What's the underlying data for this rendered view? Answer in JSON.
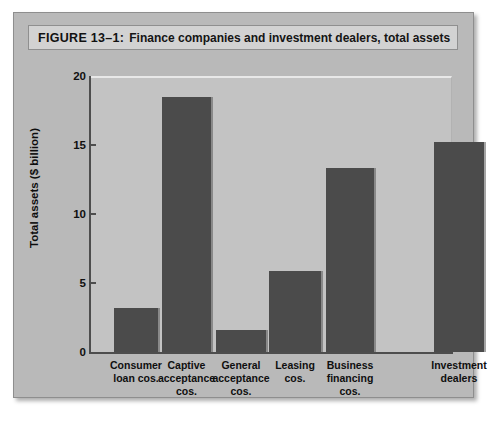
{
  "figure": {
    "caption_label": "FIGURE 13–1:",
    "caption_text": "Finance companies and investment dealers, total assets"
  },
  "colors": {
    "page_background": "#ffffff",
    "panel_background": "#b9b9b9",
    "plot_background": "#c3c3c3",
    "caption_background": "#d2d2d2",
    "bar_fill": "#4b4b4b",
    "axis": "#4d4d4d",
    "text": "#101010"
  },
  "chart_data": {
    "type": "bar",
    "title": "Finance companies and investment dealers, total assets",
    "xlabel": "",
    "ylabel": "Total assets ($ billion)",
    "ylim": [
      0,
      20
    ],
    "yticks": [
      0,
      5,
      10,
      15,
      20
    ],
    "ytick_labels": [
      "0",
      "5",
      "10",
      "15",
      "20"
    ],
    "grid": false,
    "legend": false,
    "categories": [
      "Consumer loan cos.",
      "Captive acceptance cos.",
      "General acceptance cos.",
      "Leasing cos.",
      "Business financing cos.",
      "Investment dealers"
    ],
    "category_lines": [
      [
        "Consumer",
        "loan cos."
      ],
      [
        "Captive",
        "acceptance",
        "cos."
      ],
      [
        "General",
        "acceptance",
        "cos."
      ],
      [
        "Leasing",
        "cos."
      ],
      [
        "Business",
        "financing",
        "cos."
      ],
      [
        "Investment",
        "dealers"
      ]
    ],
    "values": [
      3.2,
      18.5,
      1.6,
      5.9,
      13.3,
      15.2
    ]
  }
}
